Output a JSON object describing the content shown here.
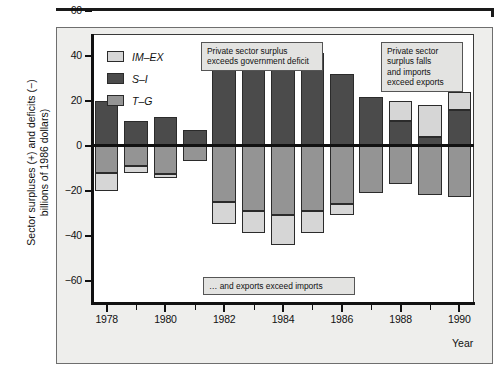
{
  "chart_data": {
    "type": "bar",
    "subtype": "stacked-bar-diverging",
    "title": "",
    "xlabel": "Year",
    "ylabel": "Sector surpluses (+) and deficits (−) billions of 1986 dollars)",
    "ylim": [
      -60,
      60
    ],
    "ytick_values": [
      60,
      40,
      20,
      0,
      -20,
      -40,
      -60
    ],
    "ytick_labels": [
      "60",
      "40",
      "20",
      "0",
      "−20",
      "−40",
      "−60"
    ],
    "xlim": [
      1977.5,
      1990.5
    ],
    "categories": [
      1978,
      1979,
      1980,
      1981,
      1982,
      1983,
      1984,
      1985,
      1986,
      1987,
      1988,
      1989,
      1990
    ],
    "xtick_labels": [
      "1978",
      "1980",
      "1982",
      "1984",
      "1986",
      "1988",
      "1990"
    ],
    "xtick_values": [
      1978,
      1980,
      1982,
      1984,
      1986,
      1988,
      1990
    ],
    "minor_ticks": [
      1979,
      1981,
      1983,
      1985,
      1987,
      1989
    ],
    "grid": false,
    "legend_position": "upper-left-inside",
    "series": [
      {
        "name": "IM–EX",
        "key": "im_ex",
        "color": "#d6d6d6",
        "values": [
          -8,
          -3,
          -2,
          0,
          -10,
          -10,
          -13,
          -10,
          -5,
          0,
          9,
          14,
          8
        ]
      },
      {
        "name": "S–I",
        "key": "s_i",
        "color": "#4b4b4b",
        "values": [
          20,
          11,
          12.5,
          7,
          35,
          38.5,
          40,
          41,
          32,
          21.5,
          11,
          4,
          16
        ]
      },
      {
        "name": "T–G",
        "key": "t_g",
        "color": "#949494",
        "values": [
          -12,
          -9,
          -12.5,
          -7,
          -25,
          -29,
          -31,
          -29,
          -26,
          -21,
          -17,
          -22,
          -23
        ]
      }
    ],
    "annotations": [
      {
        "id": "center",
        "lines": [
          "Private sector surplus",
          "exceeds government deficit"
        ]
      },
      {
        "id": "right",
        "lines": [
          "Private sector",
          "surplus falls",
          "and imports",
          "exceed exports"
        ]
      },
      {
        "id": "bottom",
        "lines": [
          "… and exports exceed imports"
        ]
      }
    ]
  },
  "legend": {
    "items": [
      {
        "label": "IM–EX",
        "swatch": "im-ex"
      },
      {
        "label": "S–I",
        "swatch": "s-i"
      },
      {
        "label": "T–G",
        "swatch": "t-g"
      }
    ]
  },
  "axes": {
    "y_title": "Sector surpluses (+) and deficits (−) billions of 1986 dollars)",
    "x_title": "Year"
  },
  "annotations": {
    "center_line1": "Private sector surplus",
    "center_line2": "exceeds government deficit",
    "right_line1": "Private sector",
    "right_line2": "surplus falls",
    "right_line3": "and imports",
    "right_line4": "exceed exports",
    "bottom_line1": "… and exports exceed imports"
  },
  "colors": {
    "im_ex": "#d6d6d6",
    "s_i": "#4b4b4b",
    "t_g": "#949494",
    "frame": "#eeeeec",
    "axis": "#111111"
  }
}
